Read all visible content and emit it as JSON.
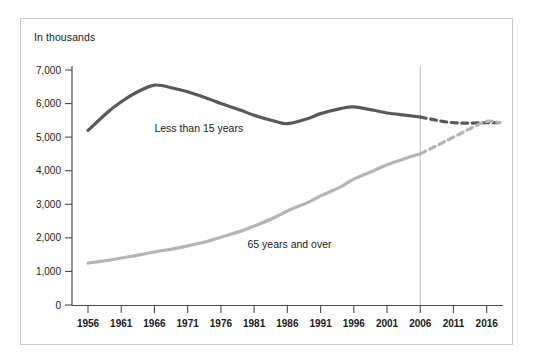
{
  "chart_data": {
    "type": "line",
    "title": "In thousands",
    "xlabel": "",
    "ylabel": "In thousands",
    "ylim": [
      0,
      7000
    ],
    "xlim": [
      1956,
      2018
    ],
    "grid": false,
    "legend_position": "inline-labels",
    "y_ticks": [
      "0",
      "1,000",
      "2,000",
      "3,000",
      "4,000",
      "5,000",
      "6,000",
      "7,000"
    ],
    "y_tick_values": [
      0,
      1000,
      2000,
      3000,
      4000,
      5000,
      6000,
      7000
    ],
    "x_ticks": [
      "1956",
      "1961",
      "1966",
      "1971",
      "1976",
      "1981",
      "1986",
      "1991",
      "1996",
      "2001",
      "2006",
      "2011",
      "2016"
    ],
    "x_tick_values": [
      1956,
      1961,
      1966,
      1971,
      1976,
      1981,
      1986,
      1991,
      1996,
      2001,
      2006,
      2011,
      2016
    ],
    "projection_start_year": 2006,
    "annotations": [
      {
        "name": "projection-divider",
        "x": 2006,
        "note": "vertical line marking start of projected data"
      }
    ],
    "series": [
      {
        "name": "Less than 15 years",
        "color": "#595959",
        "label_x": 1966,
        "label_y": 5150,
        "x": [
          1956,
          1959,
          1961,
          1963,
          1966,
          1969,
          1971,
          1974,
          1976,
          1979,
          1981,
          1984,
          1986,
          1989,
          1991,
          1994,
          1996,
          1999,
          2001,
          2004,
          2006
        ],
        "values": [
          5200,
          5750,
          6050,
          6300,
          6550,
          6450,
          6350,
          6150,
          6000,
          5800,
          5650,
          5480,
          5400,
          5550,
          5700,
          5850,
          5900,
          5800,
          5720,
          5650,
          5600
        ],
        "projected_x": [
          2006,
          2008,
          2010,
          2012,
          2014,
          2016,
          2018
        ],
        "projected_values": [
          5600,
          5520,
          5450,
          5420,
          5420,
          5430,
          5430
        ],
        "style": "solid-then-dashed"
      },
      {
        "name": "65 years and over",
        "color": "#b5b5b5",
        "label_x": 1980,
        "label_y": 1700,
        "x": [
          1956,
          1959,
          1961,
          1964,
          1966,
          1969,
          1971,
          1974,
          1976,
          1979,
          1981,
          1984,
          1986,
          1989,
          1991,
          1994,
          1996,
          1999,
          2001,
          2004,
          2006
        ],
        "values": [
          1250,
          1330,
          1400,
          1500,
          1580,
          1680,
          1760,
          1900,
          2020,
          2200,
          2350,
          2600,
          2800,
          3050,
          3250,
          3520,
          3750,
          4000,
          4180,
          4380,
          4500
        ],
        "projected_x": [
          2006,
          2008,
          2010,
          2012,
          2014,
          2016,
          2018
        ],
        "projected_values": [
          4500,
          4700,
          4900,
          5100,
          5300,
          5470,
          5430
        ],
        "style": "solid-then-dashed"
      }
    ]
  }
}
